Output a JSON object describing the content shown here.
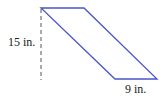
{
  "figure": {
    "shape": "parallelogram",
    "stroke_color": "#4a56c8",
    "dash_color": "#555555",
    "vertices": {
      "top_left": [
        41,
        8
      ],
      "top_right": [
        84,
        8
      ],
      "bottom_right": [
        157,
        79
      ],
      "bottom_left": [
        115,
        79
      ]
    },
    "height_line": {
      "x": 41,
      "y1": 8,
      "y2": 80
    }
  },
  "labels": {
    "height": "15 in.",
    "base": "9 in."
  }
}
